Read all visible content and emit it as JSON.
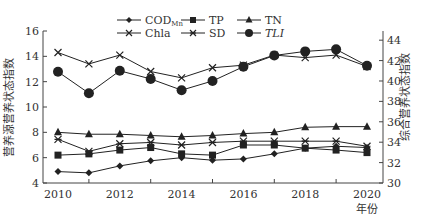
{
  "chart_data": {
    "type": "line",
    "title": "",
    "xlabel": "年份",
    "ylabel": "营养源营养状态指数",
    "ylabel_right": "综合营养状态指数",
    "x": [
      2010,
      2011,
      2012,
      2013,
      2014,
      2015,
      2016,
      2017,
      2018,
      2019,
      2020
    ],
    "x_tick_labels": [
      "2010",
      "2012",
      "2014",
      "2016",
      "2018",
      "2020"
    ],
    "ylim": [
      4,
      16
    ],
    "y_ticks": [
      4,
      6,
      8,
      10,
      12,
      14,
      16
    ],
    "ylim_right": [
      30,
      44.9
    ],
    "y_ticks_right": [
      30,
      32,
      34,
      36,
      38,
      40,
      42,
      44
    ],
    "grid": false,
    "legend_position": "top",
    "series": [
      {
        "name": "COD_Mn",
        "label_main": "COD",
        "label_sub": "Mn",
        "marker": "diamond",
        "axis": "left",
        "values": [
          4.9,
          4.8,
          5.35,
          5.75,
          6.0,
          5.8,
          5.9,
          6.3,
          6.75,
          6.9,
          6.8
        ]
      },
      {
        "name": "TP",
        "label_main": "TP",
        "label_sub": "",
        "marker": "square",
        "axis": "left",
        "values": [
          6.2,
          6.3,
          6.6,
          6.8,
          6.3,
          6.2,
          7.0,
          7.0,
          6.75,
          6.6,
          6.4
        ]
      },
      {
        "name": "TN",
        "label_main": "TN",
        "label_sub": "",
        "marker": "triangle",
        "axis": "left",
        "values": [
          8.0,
          7.85,
          7.85,
          7.75,
          7.65,
          7.75,
          7.9,
          8.0,
          8.4,
          8.45,
          8.45
        ]
      },
      {
        "name": "Chla",
        "label_main": "Chla",
        "label_sub": "",
        "marker": "x",
        "axis": "left",
        "values": [
          14.3,
          13.4,
          14.1,
          12.8,
          12.3,
          13.1,
          13.3,
          14.1,
          13.9,
          14.1,
          13.2
        ]
      },
      {
        "name": "SD",
        "label_main": "SD",
        "label_sub": "",
        "marker": "asterisk",
        "axis": "left",
        "values": [
          7.45,
          6.5,
          7.1,
          7.2,
          7.0,
          7.2,
          7.3,
          7.3,
          7.3,
          7.3,
          6.9
        ]
      },
      {
        "name": "TLI",
        "label_main": "TLI",
        "label_sub": "",
        "marker": "circle",
        "axis": "right",
        "italic": true,
        "values": [
          40.9,
          38.8,
          41.0,
          40.2,
          39.1,
          40.0,
          41.4,
          42.5,
          42.9,
          43.1,
          41.5
        ]
      }
    ]
  }
}
